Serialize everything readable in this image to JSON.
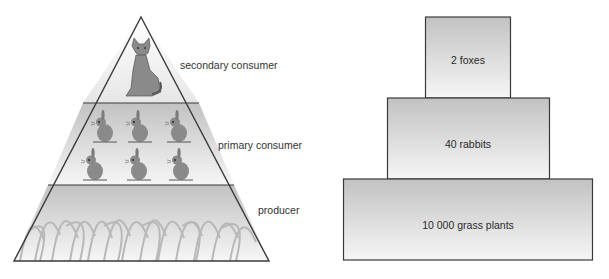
{
  "left_diagram": {
    "type": "pyramid of numbers (illustrated)",
    "levels": [
      {
        "label": "secondary consumer",
        "organism": "fox",
        "count_shown": 1
      },
      {
        "label": "primary consumer",
        "organism": "rabbit",
        "count_shown": 6
      },
      {
        "label": "producer",
        "organism": "grass"
      }
    ]
  },
  "right_diagram": {
    "type": "pyramid of numbers (blocks)",
    "levels": [
      {
        "label": "2 foxes"
      },
      {
        "label": "40 rabbits"
      },
      {
        "label": "10 000 grass plants"
      }
    ]
  },
  "colors": {
    "outline": "#3a3a3a",
    "fill_dark": "#c4c4c4",
    "fill_light": "#f4f4f4",
    "animal": "#8a8a8a",
    "grass": "#bdbdbd"
  }
}
